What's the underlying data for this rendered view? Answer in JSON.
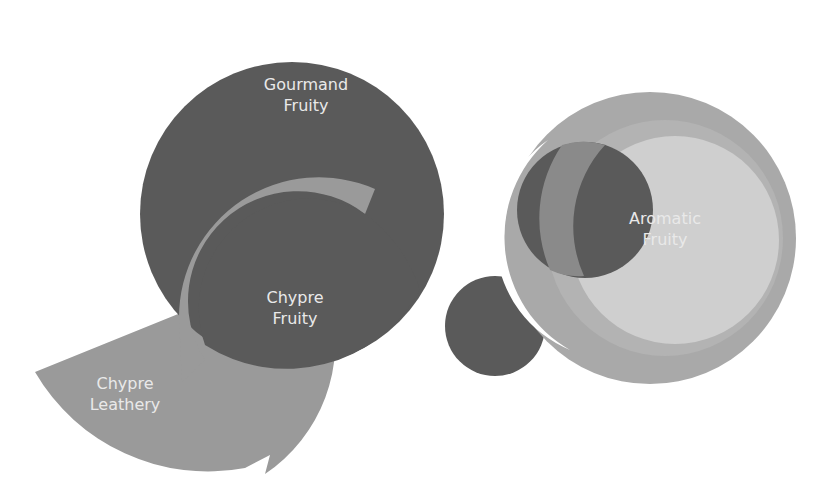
{
  "diagram": {
    "type": "overlapping-circles",
    "colors": {
      "dark": "#5a5a5a",
      "medium": "#9a9a9a",
      "ring": "#a9a9a9",
      "ring_inner": "#bdbdbd",
      "light": "#cfcfcf",
      "overlap": "#7a7a7a",
      "text": "#e9e9e9",
      "background": "#ffffff"
    },
    "nodes": [
      {
        "id": "gourmand-fruity",
        "line1": "Gourmand",
        "line2": "Fruity"
      },
      {
        "id": "chypre-fruity",
        "line1": "Chypre",
        "line2": "Fruity"
      },
      {
        "id": "chypre-leathery",
        "line1": "Chypre",
        "line2": "Leathery"
      },
      {
        "id": "aromatic-fruity",
        "line1": "Aromatic",
        "line2": "Fruity"
      }
    ]
  }
}
